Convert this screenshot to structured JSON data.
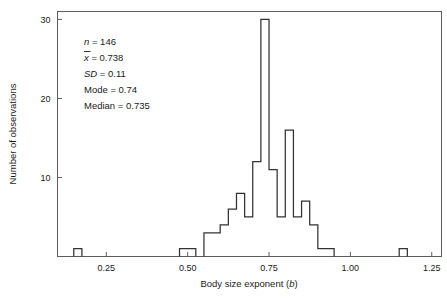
{
  "figure": {
    "xlabel_main": "Body size exponent (",
    "xlabel_italic": "b",
    "xlabel_close": ")",
    "ylabel": "Number of observations"
  },
  "stats": {
    "n_symbol": "n",
    "n_value": " = 146",
    "mean_symbol": "x",
    "mean_value": " = 0.738",
    "sd_symbol": "SD",
    "sd_value": " = 0.11",
    "mode_label": "Mode = 0.74",
    "median_label": "Median = 0.735"
  },
  "chart_data": {
    "type": "bar",
    "title": "",
    "xlabel": "Body size exponent (b)",
    "ylabel": "Number of observations",
    "xlim": [
      0.1,
      1.28
    ],
    "ylim": [
      0,
      31
    ],
    "xticks": [
      0.25,
      0.5,
      0.75,
      1.0,
      1.25
    ],
    "xtick_labels": [
      "0.25",
      "0.50",
      "0.75",
      "1.00",
      "1.25"
    ],
    "yticks": [
      10,
      20,
      30
    ],
    "ytick_labels": [
      "10",
      "20",
      "30"
    ],
    "grid": false,
    "legend": null,
    "bin_width": 0.025,
    "n_observations": 146,
    "mean": 0.738,
    "sd": 0.11,
    "mode": 0.74,
    "median": 0.735,
    "bins": [
      {
        "x0": 0.15,
        "x1": 0.175,
        "count": 1
      },
      {
        "x0": 0.475,
        "x1": 0.5,
        "count": 1
      },
      {
        "x0": 0.5,
        "x1": 0.525,
        "count": 1
      },
      {
        "x0": 0.55,
        "x1": 0.575,
        "count": 3
      },
      {
        "x0": 0.575,
        "x1": 0.6,
        "count": 3
      },
      {
        "x0": 0.6,
        "x1": 0.625,
        "count": 4
      },
      {
        "x0": 0.625,
        "x1": 0.65,
        "count": 6
      },
      {
        "x0": 0.65,
        "x1": 0.675,
        "count": 8
      },
      {
        "x0": 0.675,
        "x1": 0.7,
        "count": 5
      },
      {
        "x0": 0.7,
        "x1": 0.725,
        "count": 12
      },
      {
        "x0": 0.725,
        "x1": 0.75,
        "count": 30
      },
      {
        "x0": 0.75,
        "x1": 0.775,
        "count": 11
      },
      {
        "x0": 0.775,
        "x1": 0.8,
        "count": 5
      },
      {
        "x0": 0.8,
        "x1": 0.825,
        "count": 16
      },
      {
        "x0": 0.825,
        "x1": 0.85,
        "count": 5
      },
      {
        "x0": 0.85,
        "x1": 0.875,
        "count": 7
      },
      {
        "x0": 0.875,
        "x1": 0.9,
        "count": 4
      },
      {
        "x0": 0.9,
        "x1": 0.95,
        "count": 1
      },
      {
        "x0": 1.15,
        "x1": 1.175,
        "count": 1
      }
    ]
  }
}
